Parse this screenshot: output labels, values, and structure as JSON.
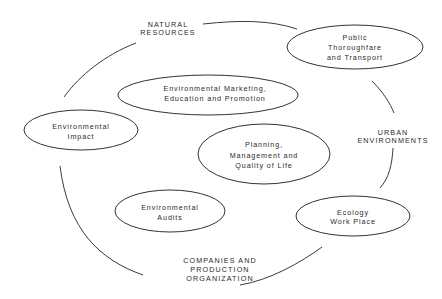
{
  "diagram": {
    "type": "cycle-diagram",
    "background": "#ffffff",
    "line_color": "#333333",
    "outer_labels": {
      "natural_resources": [
        "NATURAL",
        "RESOURCES"
      ],
      "urban_environments": [
        "URBAN",
        "ENVIRONMENTS"
      ],
      "companies": [
        "COMPANIES AND",
        "PRODUCTION",
        "ORGANIZATION"
      ]
    },
    "nodes": {
      "environmental_impact": [
        "Environmental",
        "Impact"
      ],
      "public_thoroughfare": [
        "Public",
        "Thoroughfare",
        "and Transport"
      ],
      "ecology_work_place": [
        "Ecology",
        "Work Place"
      ],
      "environmental_marketing": [
        "Environmental Marketing,",
        "Education and Promotion"
      ],
      "planning": [
        "Planning,",
        "Management and",
        "Quality of Life"
      ],
      "environmental_audits": [
        "Environmental",
        "Audits"
      ]
    }
  }
}
